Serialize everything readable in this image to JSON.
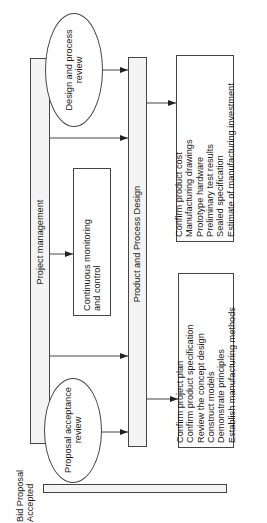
{
  "diagram": {
    "orientation": "rotated -90deg (reads bottom to top)",
    "bid_proposal": {
      "label_line1": "Bid Proposal",
      "label_line2": "Accepted"
    },
    "project_management": {
      "label": "Project management"
    },
    "design_review": {
      "line1": "Design and process",
      "line2": "review"
    },
    "proposal_review": {
      "line1": "Proposal acceptance",
      "line2": "review"
    },
    "monitoring": {
      "line1": "Continuous monitoring",
      "line2": "and control"
    },
    "product_process_design": {
      "label": "Product and Process Design"
    },
    "early_deliverables": {
      "items": [
        "Confirm project plan",
        "Confirm product specification",
        "Review the concept design",
        "Construct models",
        "Demonstrate principles",
        "Establish manufacturing methods"
      ]
    },
    "late_deliverables": {
      "items": [
        "Confirm product cost",
        "Manufacturing drawings",
        "Prototype hardware",
        "Preliminary test results",
        "Sealed specification",
        "Estimate of manufacturing investment"
      ]
    },
    "colors": {
      "line": "#444444",
      "text": "#1a1a1a",
      "background": "#ffffff",
      "bar_fill": "#f4f4f4"
    }
  }
}
